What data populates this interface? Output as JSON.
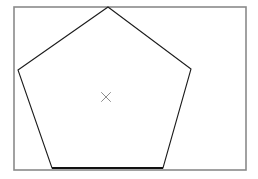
{
  "canvas": {
    "width": 258,
    "height": 179,
    "background": "#ffffff"
  },
  "frame": {
    "label": "bounding-rectangle",
    "x": 14,
    "y": 7,
    "width": 232,
    "height": 163,
    "stroke": "#8a8a8a",
    "stroke_width": 1.6,
    "fill": "none"
  },
  "pentagon": {
    "label": "pentagon",
    "sides": 5,
    "stroke": "#1c1c1c",
    "stroke_width": 1.1,
    "fill": "none",
    "points": "108,7 191,69 163,168 52,168 18,70",
    "vertices": [
      {
        "name": "apex-top",
        "x": 108,
        "y": 7
      },
      {
        "name": "vertex-right",
        "x": 191,
        "y": 69
      },
      {
        "name": "vertex-bottom-right",
        "x": 163,
        "y": 168
      },
      {
        "name": "vertex-bottom-left",
        "x": 52,
        "y": 168
      },
      {
        "name": "vertex-left",
        "x": 18,
        "y": 70
      }
    ]
  },
  "base_edge": {
    "label": "pentagon-base-edge",
    "x1": 52,
    "y1": 168,
    "x2": 163,
    "y2": 168,
    "stroke": "#111111",
    "stroke_width": 2.2
  },
  "center_mark": {
    "label": "center-cross-mark",
    "glyph": "×",
    "x": 106,
    "y": 97,
    "size": 9,
    "stroke": "#8d8d8d",
    "stroke_width": 1.0
  }
}
